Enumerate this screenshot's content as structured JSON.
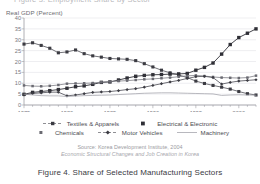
{
  "figure": {
    "top_cut_text": "Figure 3.  Employment Share by Sector",
    "caption": "Figure 4. Share of Selected Manufacturing Sectors",
    "axis_title": "Real GDP (Percent)",
    "source_line_1": "Source: Korea Development Institute, 2004",
    "source_line_2": "Economic Structural Changes and Job Creation in Korea"
  },
  "legend": {
    "rows": [
      [
        {
          "label": "Textiles & Apparels",
          "key": "line-marker-square-small"
        },
        {
          "label": "Electrical & Electronic",
          "key": "marker-square-filled"
        }
      ],
      [
        {
          "label": "Chemicals",
          "key": "marker-square-small"
        },
        {
          "label": "Motor Vehicles",
          "key": "line-marker-diamond"
        },
        {
          "label": "Machinery",
          "key": "line-plain"
        }
      ]
    ]
  },
  "colors": {
    "ink": "#4a4a50",
    "grid": "#dcdce2",
    "axis": "#9c9ca2",
    "series_dark": "#3b3b42",
    "series_mid": "#5e5e66",
    "series_light": "#8d8d95"
  },
  "chart_data": {
    "type": "line",
    "title": "Figure 4. Share of Selected Manufacturing Sectors",
    "xlabel": "",
    "ylabel": "Real GDP (Percent)",
    "xlim": [
      1975,
      2002
    ],
    "ylim": [
      0,
      40
    ],
    "ytick_step": 5,
    "yticks": [
      0,
      5,
      10,
      15,
      20,
      25,
      30,
      35,
      40
    ],
    "xticks_major": [
      1975,
      1980,
      1985,
      1990,
      1995,
      2000
    ],
    "xticks_minor_every": 1,
    "grid": true,
    "legend_position": "bottom",
    "x": [
      1975,
      1976,
      1977,
      1978,
      1979,
      1980,
      1981,
      1982,
      1983,
      1984,
      1985,
      1986,
      1987,
      1988,
      1989,
      1990,
      1991,
      1992,
      1993,
      1994,
      1995,
      1996,
      1997,
      1998,
      1999,
      2000,
      2001,
      2002
    ],
    "series": [
      {
        "name": "Textiles & Apparels",
        "marker": "square-small",
        "values": [
          28.0,
          28.6,
          27.4,
          26.1,
          24.0,
          24.4,
          25.3,
          23.6,
          22.6,
          22.0,
          21.4,
          21.2,
          21.0,
          20.4,
          19.0,
          17.5,
          16.0,
          14.8,
          13.8,
          12.6,
          11.0,
          9.9,
          9.0,
          8.2,
          7.3,
          6.2,
          5.2,
          4.6
        ]
      },
      {
        "name": "Electrical & Electronic",
        "marker": "square-filled",
        "values": [
          4.9,
          5.8,
          6.2,
          6.6,
          7.1,
          7.7,
          8.4,
          8.8,
          9.5,
          10.4,
          10.6,
          11.5,
          12.4,
          13.2,
          13.6,
          13.9,
          14.0,
          14.2,
          14.3,
          14.5,
          16.0,
          17.3,
          19.3,
          23.4,
          27.8,
          31.0,
          33.0,
          35.0
        ]
      },
      {
        "name": "Chemicals",
        "marker": "square-small",
        "values": [
          9.0,
          8.7,
          8.6,
          8.8,
          9.2,
          9.8,
          9.9,
          10.0,
          10.1,
          10.5,
          10.8,
          11.0,
          11.2,
          11.5,
          11.8,
          12.0,
          12.3,
          12.6,
          13.0,
          13.4,
          13.6,
          13.3,
          12.9,
          12.6,
          12.5,
          12.4,
          12.6,
          13.5
        ]
      },
      {
        "name": "Motor Vehicles",
        "marker": "diamond",
        "values": [
          4.6,
          5.3,
          5.6,
          5.9,
          5.9,
          4.2,
          4.6,
          5.2,
          5.8,
          6.0,
          6.2,
          6.6,
          7.1,
          7.5,
          8.2,
          9.0,
          9.8,
          10.6,
          11.3,
          12.2,
          13.0,
          13.2,
          12.6,
          9.6,
          10.4,
          11.0,
          11.3,
          11.6
        ]
      },
      {
        "name": "Machinery",
        "marker": "plain",
        "values": [
          5.0,
          4.6,
          4.3,
          4.2,
          4.2,
          3.9,
          4.1,
          4.3,
          4.4,
          4.5,
          4.6,
          4.8,
          5.0,
          5.2,
          5.4,
          5.5,
          5.6,
          5.6,
          5.5,
          5.4,
          5.3,
          5.2,
          5.1,
          4.4,
          4.6,
          4.7,
          4.6,
          4.5
        ]
      }
    ]
  }
}
